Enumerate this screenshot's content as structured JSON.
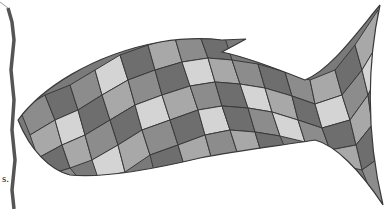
{
  "image": {
    "subject": "mosaic fish illustration",
    "palette": {
      "background": "#ffffff",
      "outline": "#3a3a3a",
      "tile_dark": "#6e6e6e",
      "tile_mid": "#8c8c8c",
      "tile_light": "#a8a8a8",
      "tile_pale": "#d4d4d4",
      "torn_edge": "#555555"
    }
  },
  "paper_fragment": {
    "text": "s."
  }
}
